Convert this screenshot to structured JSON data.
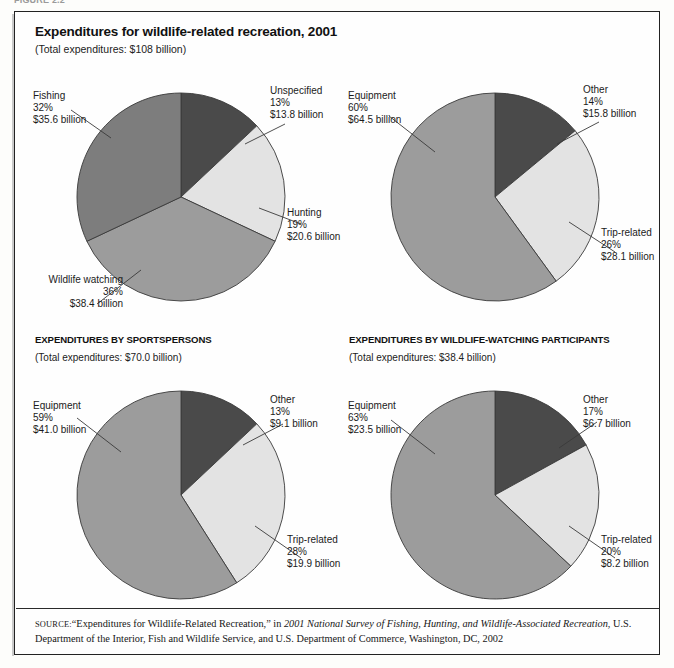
{
  "figure_strip": "FIGURE 2.2",
  "frame": {
    "title": "Expenditures for wildlife-related recreation, 2001",
    "subtitle": "(Total expenditures: $108 billion)",
    "sections": [
      {
        "heading": "EXPENDITURES BY SPORTSPERSONS",
        "subtitle": "(Total expenditures: $70.0 billion)"
      },
      {
        "heading": "EXPENDITURES BY WILDLIFE-WATCHING PARTICIPANTS",
        "subtitle": "(Total expenditures: $38.4 billion)"
      }
    ],
    "source": {
      "label": "SOURCE:",
      "text_1": "“Expenditures for Wildlife-Related Recreation,” in ",
      "italic_1": "2001 National Survey of Fishing, Hunting, and Wildlife-Associated Recreation",
      "text_2": ", U.S. Department of the Interior, Fish and Wildlife Service, and U.S. Department of Commerce, Washington, DC, 2002"
    }
  },
  "colors": {
    "darkest": "#4a4a4a",
    "dark": "#7d7d7d",
    "medium": "#9c9c9c",
    "light": "#e3e3e3",
    "outline": "#3a3a3a",
    "leader": "#3a3a3a",
    "text": "#1b1b1b"
  },
  "chart_data": [
    {
      "id": "total-expenditures",
      "type": "pie",
      "title": "Expenditures for wildlife-related recreation, 2001",
      "subtitle": "(Total expenditures: $108 billion)",
      "total_label": "$108 billion",
      "start_angle_deg": 0,
      "direction": "clockwise",
      "legend": "leader-labels",
      "slices": [
        {
          "label": "Unspecified",
          "percent": 13,
          "value": 13.8,
          "value_label": "$13.8 billion",
          "percent_label": "13%",
          "color": "#4a4a4a"
        },
        {
          "label": "Hunting",
          "percent": 19,
          "value": 20.6,
          "value_label": "$20.6 billion",
          "percent_label": "19%",
          "color": "#e3e3e3"
        },
        {
          "label": "Wildlife watching",
          "percent": 36,
          "value": 38.4,
          "value_label": "$38.4 billion",
          "percent_label": "36%",
          "color": "#9c9c9c"
        },
        {
          "label": "Fishing",
          "percent": 32,
          "value": 35.6,
          "value_label": "$35.6 billion",
          "percent_label": "32%",
          "color": "#7d7d7d"
        }
      ]
    },
    {
      "id": "expenditure-categories",
      "type": "pie",
      "title": "",
      "subtitle": "",
      "start_angle_deg": 0,
      "direction": "clockwise",
      "legend": "leader-labels",
      "slices": [
        {
          "label": "Other",
          "percent": 14,
          "value": 15.8,
          "value_label": "$15.8 billion",
          "percent_label": "14%",
          "color": "#4a4a4a"
        },
        {
          "label": "Trip-related",
          "percent": 26,
          "value": 28.1,
          "value_label": "$28.1 billion",
          "percent_label": "26%",
          "color": "#e3e3e3"
        },
        {
          "label": "Equipment",
          "percent": 60,
          "value": 64.5,
          "value_label": "$64.5 billion",
          "percent_label": "60%",
          "color": "#9c9c9c"
        }
      ]
    },
    {
      "id": "sportspersons",
      "type": "pie",
      "title": "EXPENDITURES BY SPORTSPERSONS",
      "subtitle": "(Total expenditures: $70.0 billion)",
      "total_label": "$70.0 billion",
      "start_angle_deg": 0,
      "direction": "clockwise",
      "legend": "leader-labels",
      "slices": [
        {
          "label": "Other",
          "percent": 13,
          "value": 9.1,
          "value_label": "$9.1 billion",
          "percent_label": "13%",
          "color": "#4a4a4a"
        },
        {
          "label": "Trip-related",
          "percent": 28,
          "value": 19.9,
          "value_label": "$19.9 billion",
          "percent_label": "28%",
          "color": "#e3e3e3"
        },
        {
          "label": "Equipment",
          "percent": 59,
          "value": 41.0,
          "value_label": "$41.0 billion",
          "percent_label": "59%",
          "color": "#9c9c9c"
        }
      ]
    },
    {
      "id": "wildlife-watching-participants",
      "type": "pie",
      "title": "EXPENDITURES BY WILDLIFE-WATCHING PARTICIPANTS",
      "subtitle": "(Total expenditures: $38.4 billion)",
      "total_label": "$38.4 billion",
      "start_angle_deg": 0,
      "direction": "clockwise",
      "legend": "leader-labels",
      "slices": [
        {
          "label": "Other",
          "percent": 17,
          "value": 6.7,
          "value_label": "$6.7 billion",
          "percent_label": "17%",
          "color": "#4a4a4a"
        },
        {
          "label": "Trip-related",
          "percent": 20,
          "value": 8.2,
          "value_label": "$8.2 billion",
          "percent_label": "20%",
          "color": "#e3e3e3"
        },
        {
          "label": "Equipment",
          "percent": 63,
          "value": 23.5,
          "value_label": "$23.5 billion",
          "percent_label": "63%",
          "color": "#9c9c9c"
        }
      ]
    }
  ]
}
